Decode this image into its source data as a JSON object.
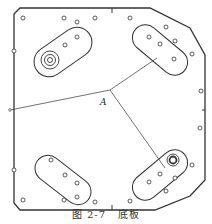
{
  "figure": {
    "number": "图 2-7",
    "title": "底板",
    "point_label": "A"
  },
  "colors": {
    "stroke": "#333333",
    "background": "#ffffff"
  },
  "plate": {
    "outline_points": "14,14 20,8 150,8 190,28 205,55 205,180 190,196 155,210 20,210 14,203",
    "center": [
      110,
      90
    ],
    "radial_lines": [
      {
        "to": [
          10,
          110
        ]
      },
      {
        "to": [
          157,
          58
        ]
      },
      {
        "to": [
          165,
          168
        ]
      }
    ]
  },
  "slots": [
    {
      "name": "slot-top-left",
      "cx": 63,
      "cy": 52,
      "rx": 32,
      "ry": 15,
      "angle": -35
    },
    {
      "name": "slot-top-right",
      "cx": 160,
      "cy": 50,
      "rx": 32,
      "ry": 13,
      "angle": 40
    },
    {
      "name": "slot-bottom-left",
      "cx": 63,
      "cy": 180,
      "rx": 32,
      "ry": 13,
      "angle": 38
    },
    {
      "name": "slot-bottom-right",
      "cx": 160,
      "cy": 175,
      "rx": 32,
      "ry": 13,
      "angle": -40
    }
  ],
  "holes": [
    [
      23,
      18
    ],
    [
      64,
      18
    ],
    [
      77,
      22
    ],
    [
      95,
      18
    ],
    [
      130,
      18
    ],
    [
      166,
      27
    ],
    [
      14,
      51
    ],
    [
      192,
      54
    ],
    [
      201,
      91
    ],
    [
      200,
      128
    ],
    [
      14,
      170
    ],
    [
      23,
      200
    ],
    [
      64,
      200
    ],
    [
      77,
      197
    ],
    [
      95,
      202
    ],
    [
      130,
      201
    ],
    [
      166,
      191
    ],
    [
      192,
      165
    ],
    [
      77,
      37
    ],
    [
      65,
      45
    ],
    [
      149,
      37
    ],
    [
      160,
      44
    ],
    [
      175,
      41
    ],
    [
      174,
      59
    ],
    [
      51,
      160
    ],
    [
      65,
      175
    ],
    [
      77,
      183
    ],
    [
      149,
      182
    ],
    [
      160,
      174
    ],
    [
      175,
      178
    ]
  ],
  "bosses": [
    {
      "name": "boss-top-left",
      "cx": 50,
      "cy": 60,
      "r": [
        9,
        5.5,
        2.5
      ]
    },
    {
      "name": "boss-bottom-right",
      "cx": 173,
      "cy": 160,
      "r": [
        6,
        3.5
      ]
    }
  ]
}
